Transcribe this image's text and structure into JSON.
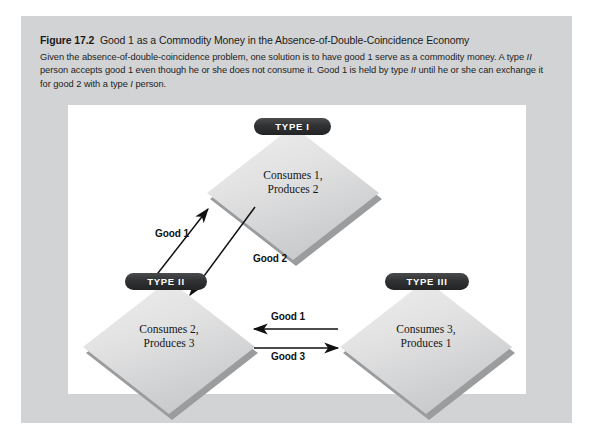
{
  "figure": {
    "number": "Figure 17.2",
    "title": "Good 1 as a Commodity Money in the Absence-of-Double-Coincidence Economy",
    "caption_line_1": "Given the absence-of-double-coincidence problem, one solution is to have good 1 serve as a commodity money. A",
    "caption_line_2_a": "type ",
    "caption_line_2_i": "II",
    "caption_line_2_b": " person accepts good 1 even though he or she does not consume it. Good 1 is held by type ",
    "caption_line_2_i2": "II",
    "caption_line_2_c": " until he or she can",
    "caption_line_3_a": "exchange it for good 2 with a type ",
    "caption_line_3_i": "I",
    "caption_line_3_b": " person."
  },
  "diagram": {
    "nodes": [
      {
        "id": "type-1",
        "pill_label": "TYPE I",
        "line_1": "Consumes 1,",
        "line_2": "Produces 2"
      },
      {
        "id": "type-2",
        "pill_label": "TYPE II",
        "line_1": "Consumes 2,",
        "line_2": "Produces 3"
      },
      {
        "id": "type-3",
        "pill_label": "TYPE III",
        "line_1": "Consumes 3,",
        "line_2": "Produces 1"
      }
    ],
    "edges": [
      {
        "id": "good-1-diagonal",
        "label": "Good 1",
        "from": "type-2",
        "to": "type-1",
        "direction": "up-right"
      },
      {
        "id": "good-2-diagonal",
        "label": "Good 2",
        "from": "type-1",
        "to": "type-2",
        "direction": "down-left"
      },
      {
        "id": "good-1-horizontal",
        "label": "Good 1",
        "from": "type-3",
        "to": "type-2",
        "direction": "left"
      },
      {
        "id": "good-3-horizontal",
        "label": "Good 3",
        "from": "type-2",
        "to": "type-3",
        "direction": "right"
      }
    ]
  },
  "colors": {
    "panel_background": "#d2d3d4",
    "canvas_background": "#ffffff",
    "pill_fill": "#2a2c2e",
    "pill_text": "#ffffff",
    "diamond_light": "#efefef",
    "diamond_dark": "#c2c3c5",
    "diamond_shadow": "#9a9c9e",
    "arrow_stroke": "#111111",
    "text_primary": "#1b1b1b"
  }
}
